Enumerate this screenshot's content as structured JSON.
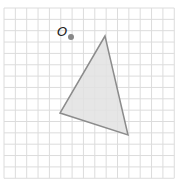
{
  "figure": {
    "width": 180,
    "height": 185,
    "grid": {
      "origin_x": 4,
      "origin_y": 8,
      "cell": 11.35,
      "cols": 15,
      "rows": 15,
      "color": "#dcdcdc",
      "background": "#ffffff"
    },
    "point_o": {
      "label": "O",
      "x": 71,
      "y": 37,
      "label_x": 57,
      "label_y": 36,
      "color": "#888888"
    },
    "triangle": {
      "vertices": [
        {
          "x": 105,
          "y": 36
        },
        {
          "x": 60,
          "y": 113
        },
        {
          "x": 128,
          "y": 135
        }
      ],
      "fill": "#e2e2e2",
      "stroke": "#8c8c8c"
    }
  }
}
